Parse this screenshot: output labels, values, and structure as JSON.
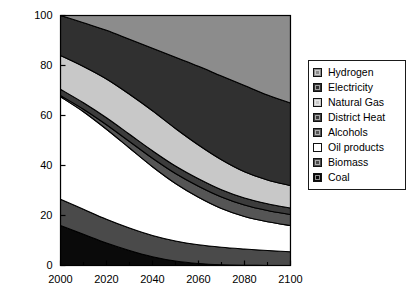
{
  "chart_data": {
    "type": "area",
    "title": "",
    "subtitle": "",
    "xlabel": "",
    "ylabel": "Global Final Energy Share (%)",
    "xlim": [
      2000,
      2100
    ],
    "ylim": [
      0,
      100
    ],
    "xticks": [
      2000,
      2020,
      2040,
      2060,
      2080,
      2100
    ],
    "xticklabels": [
      "2000",
      "2020",
      "2040",
      "2060",
      "2080",
      "2100"
    ],
    "xminorticks": [
      2010,
      2030,
      2050,
      2070,
      2090
    ],
    "yticks": [
      0,
      20,
      40,
      60,
      80,
      100
    ],
    "yticklabels": [
      "0",
      "20",
      "40",
      "60",
      "80",
      "100"
    ],
    "grid": false,
    "stacked": true,
    "stack_total": 100,
    "legend_position": "right-outside",
    "x": [
      2000,
      2010,
      2020,
      2030,
      2040,
      2050,
      2060,
      2070,
      2080,
      2090,
      2100
    ],
    "series": [
      {
        "name": "Coal",
        "color": "#0a0a0a",
        "values": [
          16.0,
          12.5,
          9.0,
          6.0,
          3.5,
          1.8,
          0.8,
          0.3,
          0.1,
          0.0,
          0.0
        ]
      },
      {
        "name": "Biomass",
        "color": "#4a4a4a",
        "values": [
          10.5,
          10.0,
          9.5,
          9.0,
          8.5,
          8.0,
          7.5,
          7.0,
          6.5,
          6.0,
          5.5
        ]
      },
      {
        "name": "Oil products",
        "color": "#ffffff",
        "values": [
          41.0,
          39.0,
          36.0,
          32.0,
          27.5,
          23.0,
          19.0,
          15.5,
          13.0,
          11.5,
          10.5
        ]
      },
      {
        "name": "Alcohols",
        "color": "#555555",
        "values": [
          0.5,
          1.0,
          1.8,
          2.6,
          3.4,
          4.0,
          4.4,
          4.6,
          4.6,
          4.5,
          4.4
        ]
      },
      {
        "name": "District Heat",
        "color": "#3c3c3c",
        "values": [
          2.5,
          2.6,
          2.8,
          2.9,
          3.0,
          3.0,
          3.0,
          2.9,
          2.8,
          2.7,
          2.6
        ]
      },
      {
        "name": "Natural Gas",
        "color": "#c8c8c8",
        "values": [
          13.5,
          14.5,
          15.5,
          16.0,
          16.0,
          15.0,
          13.5,
          12.0,
          10.5,
          9.5,
          9.0
        ]
      },
      {
        "name": "Electricity",
        "color": "#303030",
        "values": [
          16.0,
          17.5,
          19.5,
          22.0,
          25.0,
          28.5,
          31.5,
          33.5,
          34.5,
          34.0,
          33.0
        ]
      },
      {
        "name": "Hydrogen",
        "color": "#8c8c8c",
        "values": [
          0.0,
          2.9,
          5.9,
          9.5,
          13.1,
          16.7,
          20.3,
          24.2,
          28.0,
          31.8,
          35.0
        ]
      }
    ],
    "legend_entries": [
      {
        "label": "Hydrogen",
        "color": "#8c8c8c"
      },
      {
        "label": "Electricity",
        "color": "#303030"
      },
      {
        "label": "Natural Gas",
        "color": "#c8c8c8"
      },
      {
        "label": "District Heat",
        "color": "#3c3c3c"
      },
      {
        "label": "Alcohols",
        "color": "#555555"
      },
      {
        "label": "Oil products",
        "color": "#ffffff"
      },
      {
        "label": "Biomass",
        "color": "#4a4a4a"
      },
      {
        "label": "Coal",
        "color": "#0a0a0a"
      }
    ]
  }
}
